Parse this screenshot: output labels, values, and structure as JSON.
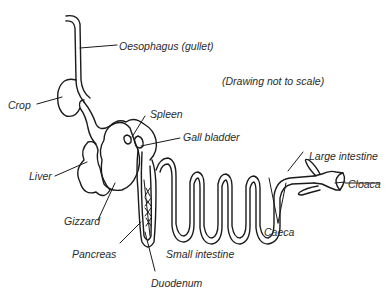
{
  "diagram": {
    "note": "(Drawing not to scale)",
    "labels": {
      "oesophagus": "Oesophagus (gullet)",
      "crop": "Crop",
      "spleen": "Spleen",
      "gall_bladder": "Gall bladder",
      "liver": "Liver",
      "gizzard": "Gizzard",
      "pancreas": "Pancreas",
      "small_intestine": "Small intestine",
      "duodenum": "Duodenum",
      "large_intestine": "Large intestine",
      "cloaca": "Cloaca",
      "caeca": "Caeca"
    },
    "colors": {
      "stroke": "#1a1a1a",
      "text": "#2a2a2a",
      "background": "#ffffff"
    }
  }
}
